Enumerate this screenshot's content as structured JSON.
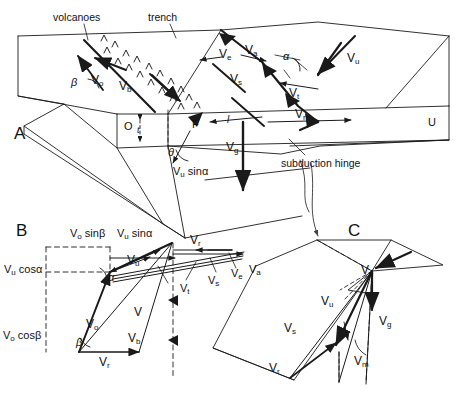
{
  "figure": {
    "domain": "scientific-diagram",
    "title_visible": false,
    "background_color": "#ffffff",
    "line_color": "#1a1a1a",
    "panels": [
      {
        "id": "A",
        "label": "A",
        "description": "3-D block diagram of a subduction zone"
      },
      {
        "id": "B",
        "label": "B",
        "description": "velocity vector triangle diagram"
      },
      {
        "id": "C",
        "label": "C",
        "description": "3-D block with velocity vectors at hinge"
      }
    ]
  },
  "panelA": {
    "letter": "A",
    "annotations": {
      "volcanoes": "volcanoes",
      "trench": "trench",
      "subduction_hinge": "subduction hinge"
    },
    "plate_labels": {
      "overriding": "O",
      "fore_arc": "F",
      "underthrusting": "U"
    },
    "thickness_label": "t",
    "angles": {
      "beta": "β",
      "alpha": "α",
      "theta": "θ"
    },
    "length_label": "l",
    "vectors": [
      {
        "name": "Vo",
        "base": "V",
        "sub": "o"
      },
      {
        "name": "Vb",
        "base": "V",
        "sub": "b"
      },
      {
        "name": "Ve",
        "base": "V",
        "sub": "e"
      },
      {
        "name": "Va",
        "base": "V",
        "sub": "a"
      },
      {
        "name": "Vs",
        "base": "V",
        "sub": "s"
      },
      {
        "name": "Vu",
        "base": "V",
        "sub": "u"
      },
      {
        "name": "Vt",
        "base": "V",
        "sub": "t"
      },
      {
        "name": "Vr",
        "base": "V",
        "sub": "r"
      },
      {
        "name": "Vg",
        "base": "V",
        "sub": "g"
      }
    ],
    "composite_label": {
      "base": "V",
      "sub": "u",
      "rest": " sinα"
    }
  },
  "panelB": {
    "letter": "B",
    "component_labels": [
      {
        "base": "V",
        "sub": "o",
        "rest": " sinβ"
      },
      {
        "base": "V",
        "sub": "u",
        "rest": " sinα"
      },
      {
        "base": "V",
        "sub": "u",
        "rest": " cosα"
      },
      {
        "base": "V",
        "sub": "o",
        "rest": " cosβ"
      }
    ],
    "angles": {
      "alpha": "α",
      "beta": "β"
    },
    "vectors": [
      {
        "name": "Vu",
        "base": "V",
        "sub": "u"
      },
      {
        "name": "Vo",
        "base": "V",
        "sub": "o"
      },
      {
        "name": "V",
        "base": "V",
        "sub": ""
      },
      {
        "name": "Vb",
        "base": "V",
        "sub": "b"
      },
      {
        "name": "Vr_bottom",
        "base": "V",
        "sub": "r"
      },
      {
        "name": "Vr_top",
        "base": "V",
        "sub": "r"
      },
      {
        "name": "Vt",
        "base": "V",
        "sub": "t"
      },
      {
        "name": "Vs",
        "base": "V",
        "sub": "s"
      },
      {
        "name": "Ve",
        "base": "V",
        "sub": "e"
      },
      {
        "name": "Va",
        "base": "V",
        "sub": "a"
      }
    ]
  },
  "panelC": {
    "letter": "C",
    "vectors": [
      {
        "name": "Vu_top",
        "base": "V",
        "sub": "u"
      },
      {
        "name": "Vu",
        "base": "V",
        "sub": "u"
      },
      {
        "name": "Vg",
        "base": "V",
        "sub": "g"
      },
      {
        "name": "Vs",
        "base": "V",
        "sub": "s"
      },
      {
        "name": "Vr",
        "base": "V",
        "sub": "r"
      },
      {
        "name": "Vm",
        "base": "V",
        "sub": "m"
      }
    ]
  }
}
